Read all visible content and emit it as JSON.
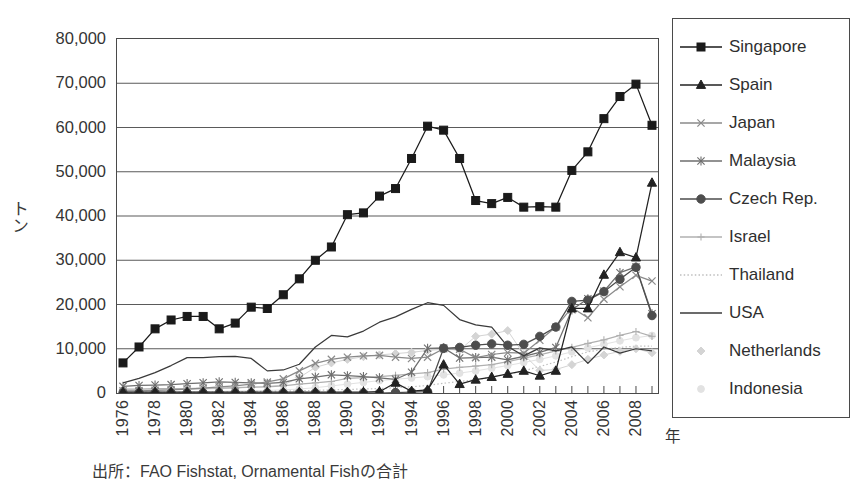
{
  "chart_data": {
    "type": "line",
    "title": "",
    "subtitle": "",
    "xlabel": "年",
    "ylabel": "トン",
    "source_note": "出所：FAO Fishstat, Ornamental Fishの合計",
    "grid": true,
    "legend_position": "right",
    "ylim": [
      0,
      80000
    ],
    "ytick_labels": [
      "0",
      "10,000",
      "20,000",
      "30,000",
      "40,000",
      "50,000",
      "60,000",
      "70,000",
      "80,000"
    ],
    "ytick_values": [
      0,
      10000,
      20000,
      30000,
      40000,
      50000,
      60000,
      70000,
      80000
    ],
    "xlim": [
      1976,
      2009
    ],
    "xtick_labels": [
      "1976",
      "1978",
      "1980",
      "1982",
      "1984",
      "1986",
      "1988",
      "1990",
      "1992",
      "1994",
      "1996",
      "1998",
      "2000",
      "2002",
      "2004",
      "2006",
      "2008"
    ],
    "xtick_values": [
      1976,
      1978,
      1980,
      1982,
      1984,
      1986,
      1988,
      1990,
      1992,
      1994,
      1996,
      1998,
      2000,
      2002,
      2004,
      2006,
      2008
    ],
    "x": [
      1976,
      1977,
      1978,
      1979,
      1980,
      1981,
      1982,
      1983,
      1984,
      1985,
      1986,
      1987,
      1988,
      1989,
      1990,
      1991,
      1992,
      1993,
      1994,
      1995,
      1996,
      1997,
      1998,
      1999,
      2000,
      2001,
      2002,
      2003,
      2004,
      2005,
      2006,
      2007,
      2008,
      2009
    ],
    "series": [
      {
        "name": "Singapore",
        "marker": "filled-square",
        "color": "#1a1a1a",
        "values": [
          6800,
          10400,
          14500,
          16500,
          17300,
          17300,
          14500,
          15800,
          19400,
          19100,
          22200,
          25800,
          30000,
          33000,
          40300,
          40700,
          44500,
          46200,
          53000,
          60300,
          59400,
          53000,
          43500,
          42800,
          44200,
          42000,
          42100,
          42000,
          50300,
          54500,
          62000,
          67000,
          69800,
          60500
        ]
      },
      {
        "name": "Spain",
        "marker": "filled-triangle",
        "color": "#222222",
        "values": [
          200,
          200,
          200,
          200,
          200,
          200,
          200,
          200,
          200,
          200,
          200,
          200,
          200,
          200,
          200,
          200,
          300,
          2300,
          400,
          700,
          6400,
          2000,
          3000,
          3600,
          4300,
          5000,
          3900,
          5000,
          19100,
          19100,
          26700,
          31800,
          30600,
          47500
        ]
      },
      {
        "name": "Japan",
        "marker": "x-cross",
        "color": "#8a8a8a",
        "values": [
          500,
          500,
          600,
          700,
          900,
          1100,
          1400,
          1600,
          2000,
          2500,
          3200,
          5000,
          6700,
          7600,
          8100,
          8400,
          8500,
          8100,
          7800,
          8100,
          10000,
          9900,
          8000,
          8700,
          9100,
          9000,
          11900,
          14900,
          19300,
          17000,
          21200,
          24000,
          26600,
          25300
        ]
      },
      {
        "name": "Malaysia",
        "marker": "asterisk",
        "color": "#6e6e6e",
        "values": [
          1500,
          1700,
          1800,
          1900,
          2100,
          2300,
          2500,
          2400,
          2300,
          2200,
          2400,
          3200,
          3600,
          4100,
          3900,
          3700,
          3400,
          3100,
          4700,
          10100,
          10200,
          7900,
          8000,
          8100,
          7500,
          8300,
          9200,
          10300,
          18800,
          21300,
          23000,
          27200,
          28500,
          17900
        ]
      },
      {
        "name": "Czech Rep.",
        "marker": "filled-circle",
        "color": "#4d4d4d",
        "values": [
          0,
          0,
          0,
          0,
          0,
          0,
          0,
          0,
          0,
          0,
          0,
          0,
          0,
          0,
          0,
          0,
          0,
          100,
          200,
          300,
          10100,
          10300,
          10800,
          11100,
          10800,
          11000,
          12800,
          14900,
          20700,
          21000,
          22900,
          25700,
          28400,
          17500
        ]
      },
      {
        "name": "Israel",
        "marker": "plus",
        "color": "#b0b0b0",
        "values": [
          900,
          900,
          1000,
          1000,
          1000,
          1100,
          1100,
          1200,
          1300,
          1400,
          1600,
          2000,
          2300,
          2600,
          3300,
          3500,
          3700,
          4000,
          4300,
          4600,
          5400,
          5800,
          6100,
          6400,
          7100,
          7900,
          8600,
          9500,
          10300,
          11200,
          12000,
          13000,
          13900,
          12800
        ]
      },
      {
        "name": "Thailand",
        "marker": "dotted",
        "color": "#bfbfbf",
        "values": [
          100,
          120,
          150,
          180,
          200,
          230,
          260,
          300,
          350,
          400,
          450,
          500,
          600,
          700,
          800,
          900,
          1000,
          1200,
          1400,
          1700,
          2200,
          2600,
          3000,
          3600,
          4200,
          5000,
          6000,
          7000,
          8200,
          9300,
          9900,
          10300,
          10600,
          10600
        ]
      },
      {
        "name": "USA",
        "marker": "solid-line",
        "color": "#3a3a3a",
        "values": [
          2300,
          3300,
          4600,
          6200,
          8000,
          8000,
          8200,
          8300,
          7800,
          5000,
          5200,
          6500,
          10400,
          13000,
          12700,
          14000,
          16000,
          17200,
          18900,
          20400,
          19800,
          16600,
          15400,
          14900,
          10500,
          8400,
          10200,
          9500,
          10400,
          6700,
          10400,
          9000,
          10000,
          9500
        ]
      },
      {
        "name": "Netherlands",
        "marker": "faint-diamond",
        "color": "#d4d4d4",
        "values": [
          600,
          650,
          700,
          750,
          800,
          900,
          1000,
          1100,
          1300,
          1500,
          1800,
          3500,
          5800,
          6800,
          7600,
          8200,
          8600,
          8900,
          9200,
          9600,
          9900,
          9700,
          12800,
          13300,
          14100,
          8700,
          5100,
          5300,
          6400,
          7600,
          8600,
          9400,
          10000,
          9100
        ]
      },
      {
        "name": "Indonesia",
        "marker": "faint-dot",
        "color": "#e2e2e2",
        "values": [
          200,
          220,
          250,
          280,
          320,
          360,
          400,
          460,
          520,
          600,
          700,
          900,
          1200,
          1600,
          2000,
          2400,
          2800,
          3100,
          3400,
          3700,
          4100,
          4500,
          5000,
          5600,
          6200,
          6900,
          7600,
          8400,
          9300,
          10200,
          11000,
          11800,
          12500,
          13000
        ]
      }
    ]
  }
}
